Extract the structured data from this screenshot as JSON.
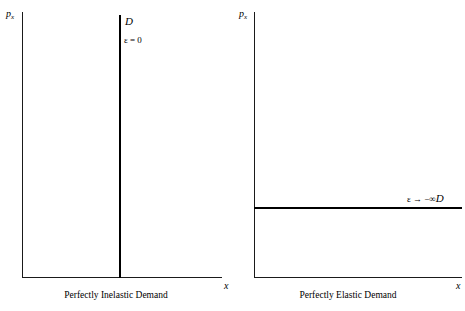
{
  "figure": {
    "background_color": "#ffffff",
    "ink_color": "#000000"
  },
  "chart_data": [
    {
      "type": "line",
      "title": "Perfectly Inelastic Demand",
      "xlabel": "x",
      "ylabel": "p",
      "ylabel_subscript": "x",
      "grid": false,
      "legend": "none",
      "axes": {
        "x_ticks": [],
        "y_ticks": [],
        "x_range_label": "",
        "y_range_label": ""
      },
      "series": [
        {
          "name": "D",
          "orientation": "vertical",
          "description": "Vertical demand curve at a fixed quantity",
          "x": [
            0.5,
            0.5
          ],
          "y": [
            0.0,
            1.0
          ],
          "curve_label": "D",
          "elasticity_label": "ε = 0"
        }
      ]
    },
    {
      "type": "line",
      "title": "Perfectly Elastic Demand",
      "xlabel": "x",
      "ylabel": "p",
      "ylabel_subscript": "x",
      "grid": false,
      "legend": "none",
      "axes": {
        "x_ticks": [],
        "y_ticks": [],
        "x_range_label": "",
        "y_range_label": ""
      },
      "series": [
        {
          "name": "D",
          "orientation": "horizontal",
          "description": "Horizontal demand curve at a fixed price",
          "x": [
            0.0,
            1.0
          ],
          "y": [
            0.26,
            0.26
          ],
          "curve_label": "D",
          "elasticity_label": "ε → −∞"
        }
      ]
    }
  ],
  "panels": {
    "inelastic": {
      "y_axis_label": "p",
      "y_axis_subscript": "x",
      "x_axis_label": "x",
      "curve_label": "D",
      "elasticity_label": "ε = 0",
      "caption": "Perfectly Inelastic Demand"
    },
    "elastic": {
      "y_axis_label": "p",
      "y_axis_subscript": "x",
      "x_axis_label": "x",
      "curve_label": "D",
      "elasticity_label": "ε → −∞",
      "caption": "Perfectly Elastic Demand"
    }
  }
}
